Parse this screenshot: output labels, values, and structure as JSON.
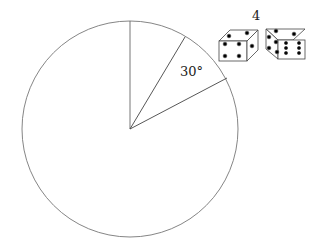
{
  "diagram": {
    "sector_angle_label": "30°",
    "dice_label": "4",
    "circle": {
      "cx": 130,
      "cy": 129,
      "r": 108
    },
    "die_left_faces": {
      "top": 2,
      "front": 4,
      "side": 1
    },
    "die_right_faces": {
      "top": 2,
      "front": 6,
      "side": 4
    }
  }
}
